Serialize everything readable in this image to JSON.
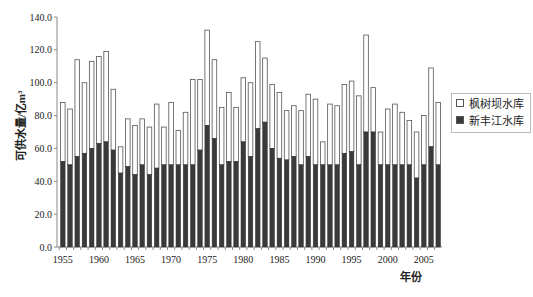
{
  "chart_data": {
    "type": "bar",
    "stacked": true,
    "title": "",
    "xlabel": "年份",
    "ylabel": "可供水量/亿m³",
    "ylim": [
      0,
      140
    ],
    "yticks": [
      "0.0",
      "20.0",
      "40.0",
      "60.0",
      "80.0",
      "100.0",
      "120.0",
      "140.0"
    ],
    "xticks": [
      "1955",
      "1960",
      "1965",
      "1970",
      "1975",
      "1980",
      "1985",
      "1990",
      "1995",
      "2000",
      "2005"
    ],
    "legend_position": "right",
    "grid": false,
    "categories": [
      1955,
      1956,
      1957,
      1958,
      1959,
      1960,
      1961,
      1962,
      1963,
      1964,
      1965,
      1966,
      1967,
      1968,
      1969,
      1970,
      1971,
      1972,
      1973,
      1974,
      1975,
      1976,
      1977,
      1978,
      1979,
      1980,
      1981,
      1982,
      1983,
      1984,
      1985,
      1986,
      1987,
      1988,
      1989,
      1990,
      1991,
      1992,
      1993,
      1994,
      1995,
      1996,
      1997,
      1998,
      1999,
      2000,
      2001,
      2002,
      2003,
      2004,
      2005,
      2006,
      2007
    ],
    "series": [
      {
        "name": "新丰江水库",
        "color": "#3a3a3a",
        "values": [
          52,
          50,
          55,
          57,
          60,
          63,
          64,
          59,
          45,
          49,
          44,
          50,
          44,
          48,
          50,
          50,
          50,
          50,
          50,
          59,
          74,
          66,
          50,
          52,
          52,
          64,
          55,
          72,
          76,
          60,
          54,
          53,
          55,
          50,
          55,
          50,
          50,
          50,
          50,
          57,
          58,
          50,
          70,
          70,
          50,
          50,
          50,
          50,
          50,
          42,
          50,
          61,
          50
        ]
      },
      {
        "name": "枫树坝水库",
        "color": "#ffffff",
        "totals": [
          88,
          84,
          114,
          100,
          113,
          116,
          119,
          96,
          61,
          78,
          74,
          78,
          73,
          87,
          73,
          88,
          71,
          82,
          102,
          102,
          132,
          114,
          85,
          94,
          85,
          103,
          100,
          125,
          115,
          99,
          94,
          83,
          86,
          83,
          93,
          90,
          64,
          87,
          86,
          99,
          101,
          92,
          129,
          97,
          70,
          84,
          87,
          82,
          77,
          70,
          80,
          109,
          88
        ]
      }
    ]
  },
  "legend": {
    "items": [
      {
        "label": "枫树坝水库",
        "color": "#ffffff"
      },
      {
        "label": "新丰江水库",
        "color": "#3a3a3a"
      }
    ]
  },
  "axes": {
    "xlabel": "年份",
    "ylabel": "可供水量/亿m³"
  }
}
